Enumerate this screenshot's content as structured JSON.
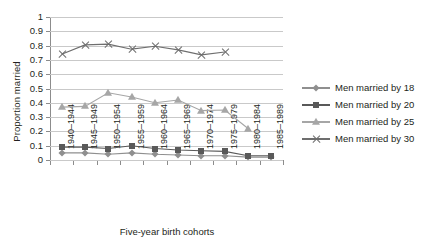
{
  "chart_data": {
    "type": "line",
    "title": "",
    "xlabel": "Five-year birth cohorts",
    "ylabel": "Proportion married",
    "ylim": [
      0,
      1
    ],
    "ytick_labels": [
      "1",
      "0.9",
      "0.8",
      "0.7",
      "0.6",
      "0.5",
      "0.4",
      "0.3",
      "0.2",
      "0.1",
      "0"
    ],
    "grid": true,
    "legend_position": "right",
    "categories": [
      "1940–1944",
      "1945–1949",
      "1950–1954",
      "1955–1959",
      "1960–1964",
      "1965–1969",
      "1970–1974",
      "1975–1979",
      "1980–1984",
      "1985–1989"
    ],
    "series": [
      {
        "name": "Men married by 18",
        "marker": "diamond",
        "color": "#8f8f8f",
        "values": [
          0.05,
          0.05,
          0.04,
          0.05,
          0.04,
          0.035,
          0.03,
          0.03,
          0.02,
          0.02
        ]
      },
      {
        "name": "Men married by 20",
        "marker": "square",
        "color": "#595959",
        "values": [
          0.09,
          0.09,
          0.08,
          0.1,
          0.08,
          0.07,
          0.065,
          0.06,
          0.03,
          0.03
        ]
      },
      {
        "name": "Men married by 25",
        "marker": "triangle",
        "color": "#a6a6a6",
        "values": [
          0.37,
          0.375,
          0.47,
          0.44,
          0.4,
          0.42,
          0.345,
          0.35,
          0.22,
          null
        ]
      },
      {
        "name": "Men married by 30",
        "marker": "x",
        "color": "#6e6e6e",
        "values": [
          0.74,
          0.805,
          0.81,
          0.775,
          0.795,
          0.77,
          0.735,
          0.755,
          null,
          null
        ]
      }
    ]
  }
}
